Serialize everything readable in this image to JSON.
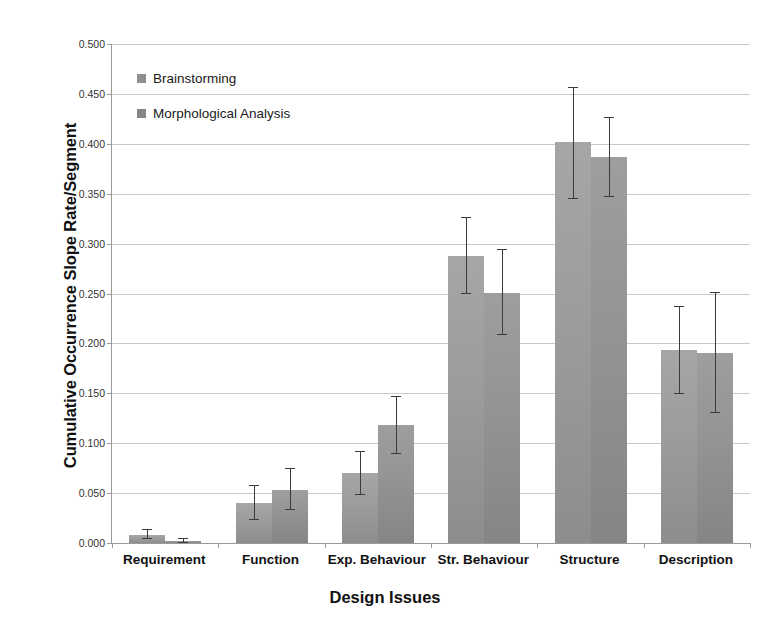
{
  "chart_data": {
    "type": "bar",
    "title": "",
    "xlabel": "Design Issues",
    "ylabel": "Cumulative Occurrence Slope Rate/Segment",
    "ylim": [
      0.0,
      0.5
    ],
    "ytick_labels": [
      "0.000",
      "0.050",
      "0.100",
      "0.150",
      "0.200",
      "0.250",
      "0.300",
      "0.350",
      "0.400",
      "0.450",
      "0.500"
    ],
    "ytick_values": [
      0.0,
      0.05,
      0.1,
      0.15,
      0.2,
      0.25,
      0.3,
      0.35,
      0.4,
      0.45,
      0.5
    ],
    "grid": true,
    "legend_position": "upper-left-inside",
    "categories": [
      "Requirement",
      "Function",
      "Exp. Behaviour",
      "Str. Behaviour",
      "Structure",
      "Description"
    ],
    "series": [
      {
        "name": "Brainstorming",
        "color": "#9c9c9c",
        "values": [
          0.008,
          0.04,
          0.07,
          0.288,
          0.402,
          0.193
        ],
        "err_low": [
          0.004,
          0.023,
          0.048,
          0.249,
          0.345,
          0.149
        ],
        "err_high": [
          0.014,
          0.058,
          0.092,
          0.327,
          0.457,
          0.237
        ]
      },
      {
        "name": "Morphological Analysis",
        "color": "#949494",
        "values": [
          0.002,
          0.053,
          0.118,
          0.251,
          0.387,
          0.19
        ],
        "err_low": [
          0.0,
          0.033,
          0.089,
          0.208,
          0.347,
          0.13
        ],
        "err_high": [
          0.005,
          0.075,
          0.147,
          0.295,
          0.427,
          0.252
        ]
      }
    ]
  },
  "legend": {
    "items": [
      {
        "label": "Brainstorming"
      },
      {
        "label": "Morphological Analysis"
      }
    ]
  },
  "axes": {
    "y_title": "Cumulative Occurrence Slope Rate/Segment",
    "x_title": "Design Issues"
  }
}
